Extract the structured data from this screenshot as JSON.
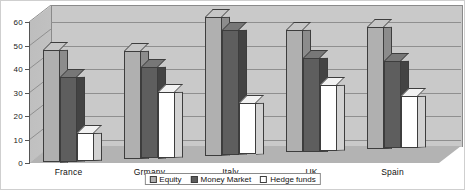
{
  "chart_data": {
    "type": "bar",
    "title": "",
    "subtitle": "",
    "xlabel": "",
    "ylabel": "",
    "ylim": [
      0,
      60
    ],
    "ytick_step": 10,
    "yticks": [
      "0",
      "10",
      "20",
      "30",
      "40",
      "50",
      "60"
    ],
    "grid": true,
    "legend_position": "bottom",
    "style": "3d-grouped-bar-grayscale",
    "categories": [
      "France",
      "Grmany",
      "Italy",
      "UK",
      "Spain"
    ],
    "series": [
      {
        "name": "Equity",
        "color": "#b0b0b0",
        "values": [
          48,
          46,
          59,
          52,
          52
        ]
      },
      {
        "name": "Money Market",
        "color": "#5e5e5e",
        "values": [
          36,
          39,
          53,
          40,
          37
        ]
      },
      {
        "name": "Hedge funds",
        "color": "#ffffff",
        "values": [
          12,
          28,
          22,
          28,
          22
        ]
      }
    ]
  },
  "legend": {
    "items": [
      {
        "label": "Equity"
      },
      {
        "label": "Money Market"
      },
      {
        "label": "Hedge funds"
      }
    ]
  },
  "colors": {
    "backwall": "#c9c9c9",
    "floor": "#b3b3b3",
    "gridline": "#8f8f8f",
    "axis": "#555555",
    "text": "#111111",
    "border": "#3d3d3d"
  }
}
